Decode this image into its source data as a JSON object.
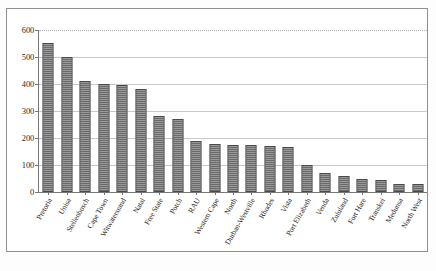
{
  "chart_data": {
    "type": "bar",
    "title": "",
    "subtitle": "",
    "xlabel": "",
    "ylabel": "",
    "ylim": [
      0,
      600
    ],
    "ytick_step": 100,
    "yticks": [
      "600",
      "500",
      "400",
      "300",
      "200",
      "100",
      "0"
    ],
    "grid": "horizontal",
    "legend": "none",
    "orientation": "vertical",
    "bar_fill": "#b9b9b9",
    "bar_border": "#4a4a4a",
    "axis_color": "#777777",
    "gridline_color": "#c9c9c9",
    "categories": [
      "Pretoria",
      "Unisa",
      "Stellenbosch",
      "Cape Town",
      "Witwatersrand",
      "Natal",
      "Free State",
      "Potch",
      "RAU",
      "Western Cape",
      "North",
      "Durban-Westville",
      "Rhodes",
      "Vista",
      "Port Elizabeth",
      "Venda",
      "Zululand",
      "Fort Hare",
      "Transkei",
      "Medunsa",
      "North West"
    ],
    "values": [
      551,
      500,
      410,
      400,
      395,
      380,
      280,
      270,
      190,
      178,
      175,
      175,
      172,
      168,
      100,
      72,
      60,
      48,
      45,
      30,
      28
    ]
  },
  "caption": {
    "text": ""
  }
}
